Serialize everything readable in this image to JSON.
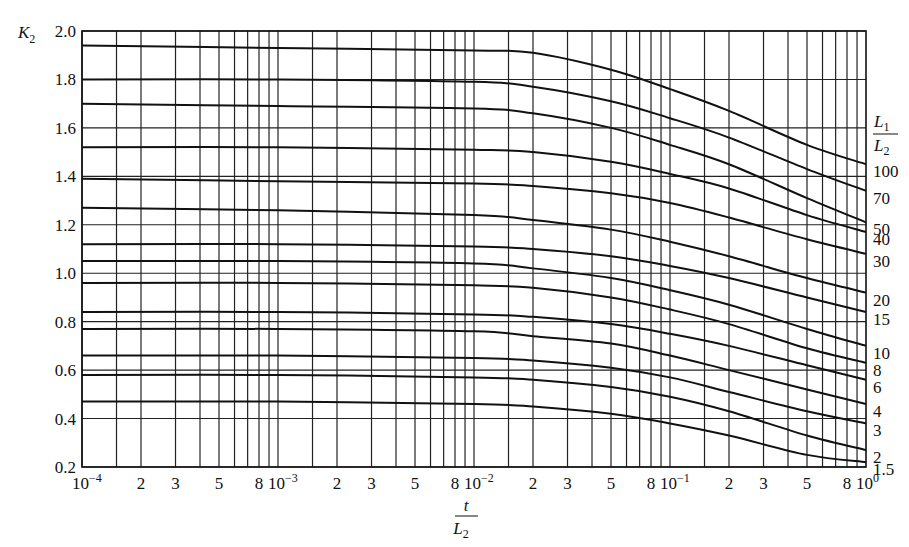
{
  "chart_data": {
    "type": "line",
    "title": "",
    "xlabel": "t / L2",
    "ylabel": "K2",
    "xscale": "log",
    "xlim": [
      0.0001,
      1
    ],
    "ylim": [
      0.2,
      2.0
    ],
    "grid": true,
    "x_tick_labels": [
      "10^-4",
      "2",
      "3",
      "5",
      "8",
      "10^-3",
      "2",
      "3",
      "5",
      "8",
      "10^-2",
      "2",
      "3",
      "5",
      "8",
      "10^-1",
      "2",
      "3",
      "5",
      "8",
      "10^0"
    ],
    "x_gridlines_per_decade": [
      1,
      1.5,
      2,
      3,
      4,
      5,
      6,
      7,
      8,
      9
    ],
    "y_tick_labels": [
      "0.2",
      "0.4",
      "0.6",
      "0.8",
      "1.0",
      "1.2",
      "1.4",
      "1.6",
      "1.8",
      "2.0"
    ],
    "legend_title": "L1 / L2",
    "legend_position": "right, labels at curve ends",
    "x": [
      0.0001,
      0.001,
      0.01,
      0.02,
      0.05,
      0.1,
      0.2,
      0.5,
      1.0
    ],
    "series": [
      {
        "name": "100",
        "values": [
          1.94,
          1.93,
          1.92,
          1.91,
          1.84,
          1.76,
          1.67,
          1.53,
          1.45
        ]
      },
      {
        "name": "70",
        "values": [
          1.8,
          1.8,
          1.79,
          1.77,
          1.71,
          1.64,
          1.56,
          1.43,
          1.34
        ]
      },
      {
        "name": "50",
        "values": [
          1.7,
          1.69,
          1.68,
          1.66,
          1.6,
          1.53,
          1.45,
          1.31,
          1.21
        ]
      },
      {
        "name": "40",
        "values": [
          1.52,
          1.52,
          1.51,
          1.5,
          1.46,
          1.41,
          1.35,
          1.24,
          1.17
        ]
      },
      {
        "name": "30",
        "values": [
          1.39,
          1.38,
          1.37,
          1.36,
          1.33,
          1.29,
          1.23,
          1.14,
          1.08
        ]
      },
      {
        "name": "20",
        "values": [
          1.27,
          1.26,
          1.24,
          1.22,
          1.18,
          1.13,
          1.07,
          0.98,
          0.92
        ]
      },
      {
        "name": "15",
        "values": [
          1.12,
          1.12,
          1.11,
          1.1,
          1.07,
          1.03,
          0.98,
          0.9,
          0.84
        ]
      },
      {
        "name": "10",
        "values": [
          1.05,
          1.05,
          1.04,
          1.02,
          0.98,
          0.93,
          0.87,
          0.77,
          0.7
        ]
      },
      {
        "name": "8",
        "values": [
          0.96,
          0.96,
          0.95,
          0.94,
          0.9,
          0.85,
          0.79,
          0.69,
          0.63
        ]
      },
      {
        "name": "6",
        "values": [
          0.84,
          0.84,
          0.83,
          0.82,
          0.79,
          0.75,
          0.7,
          0.62,
          0.56
        ]
      },
      {
        "name": "4",
        "values": [
          0.77,
          0.77,
          0.76,
          0.74,
          0.71,
          0.66,
          0.6,
          0.52,
          0.46
        ]
      },
      {
        "name": "3",
        "values": [
          0.66,
          0.66,
          0.65,
          0.64,
          0.61,
          0.57,
          0.51,
          0.43,
          0.38
        ]
      },
      {
        "name": "2",
        "values": [
          0.58,
          0.58,
          0.57,
          0.56,
          0.53,
          0.49,
          0.43,
          0.33,
          0.27
        ]
      },
      {
        "name": "1.5",
        "values": [
          0.47,
          0.47,
          0.46,
          0.45,
          0.42,
          0.38,
          0.33,
          0.25,
          0.22
        ]
      }
    ]
  },
  "labels": {
    "y_axis_main": "K",
    "y_axis_sub": "2",
    "x_axis_num": "t",
    "x_axis_den_main": "L",
    "x_axis_den_sub": "2",
    "legend_num_main": "L",
    "legend_num_sub": "1",
    "legend_den_main": "L",
    "legend_den_sub": "2"
  }
}
